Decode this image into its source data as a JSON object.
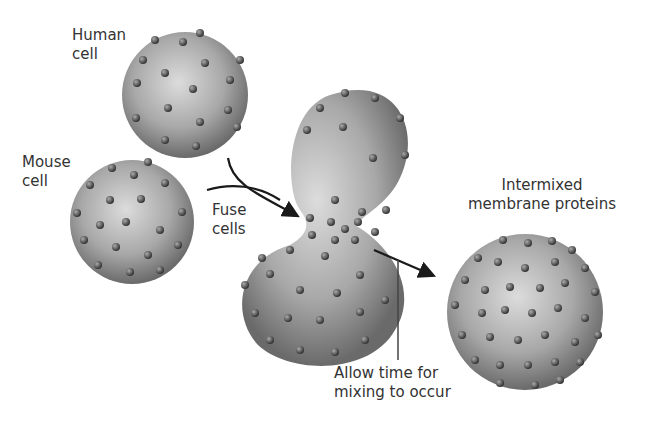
{
  "labels": {
    "human_cell": [
      "Human",
      "cell"
    ],
    "mouse_cell": [
      "Mouse",
      "cell"
    ],
    "fuse_cells": [
      "Fuse",
      "cells"
    ],
    "intermixed": [
      "Intermixed",
      "membrane proteins"
    ],
    "allow_time": [
      "Allow time for",
      "mixing to occur"
    ]
  },
  "colors": {
    "cell_light": "#d9d9d9",
    "cell_dark": "#6e6e6e",
    "protein": "#555555",
    "arrow": "#1a1a1a",
    "text": "#333333"
  }
}
